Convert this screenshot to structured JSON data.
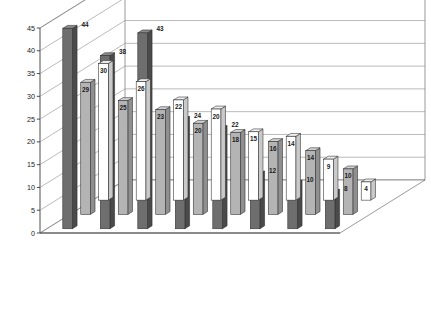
{
  "chart_data": {
    "type": "bar",
    "title": "",
    "subtitle": "",
    "xlabel": "",
    "ylabel": "",
    "ylim": [
      0,
      45
    ],
    "yticks": [
      0,
      5,
      10,
      15,
      20,
      25,
      30,
      35,
      40,
      45
    ],
    "grid": true,
    "three_d": true,
    "legend_position": "top-right",
    "categories": [
      "Puerto Ricans",
      "Native Blacks",
      "Dominicans",
      "West Indians",
      "South Americans",
      "Chinese",
      "Russian Jews",
      "Native Whites"
    ],
    "series": [
      {
        "name": "Crime",
        "color": "#ffffff",
        "values": [
          30,
          26,
          22,
          20,
          15,
          14,
          9,
          4
        ]
      },
      {
        "name": "Disrespect for Authority",
        "color": "#b4b4b4",
        "values": [
          29,
          25,
          23,
          20,
          18,
          16,
          14,
          10
        ]
      },
      {
        "name": "Open Use/Sale of Drugs",
        "color": "#6e6e6e",
        "values": [
          44,
          38,
          43,
          24,
          22,
          12,
          10,
          8
        ]
      }
    ]
  },
  "legend": {
    "items": [
      {
        "label": "Crime",
        "swatch": "#ffffff"
      },
      {
        "label": "Disrespect for Authority",
        "swatch": "#b4b4b4"
      },
      {
        "label": "Open Use/Sale of Drugs",
        "swatch": "#6e6e6e"
      }
    ]
  },
  "colors": {
    "series_crime": "#ffffff",
    "series_disrespect": "#b4b4b4",
    "series_drugs": "#6e6e6e",
    "axis": "#3a3a3a",
    "grid": "#8c8c8c",
    "background": "#ffffff"
  },
  "category_label_lines": [
    [
      "Puerto",
      "Ricans"
    ],
    [
      "Native",
      "Blacks"
    ],
    [
      "Dominicans",
      ""
    ],
    [
      "West Indians",
      ""
    ],
    [
      "South",
      "Americans"
    ],
    [
      "Chinese",
      ""
    ],
    [
      "Russian",
      "Jews"
    ],
    [
      "Native",
      "Whites"
    ]
  ]
}
